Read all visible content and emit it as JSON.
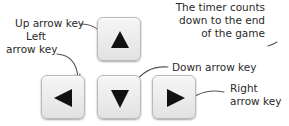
{
  "labels": {
    "up": "Up arrow key",
    "left_line1": "Left",
    "left_line2": "arrow key",
    "down": "Down arrow key",
    "right_line1": "Right",
    "right_line2": "arrow key",
    "timer_line1": "The timer counts",
    "timer_line2": "down to the end",
    "timer_line3": "of the game"
  },
  "keys": [
    {
      "name": "up",
      "icon": "triangle-up-icon"
    },
    {
      "name": "left",
      "icon": "triangle-left-icon"
    },
    {
      "name": "down",
      "icon": "triangle-down-icon"
    },
    {
      "name": "right",
      "icon": "triangle-right-icon"
    }
  ],
  "colors": {
    "key_face": "#ececec",
    "glyph": "#111111",
    "leader_line": "#555555"
  }
}
